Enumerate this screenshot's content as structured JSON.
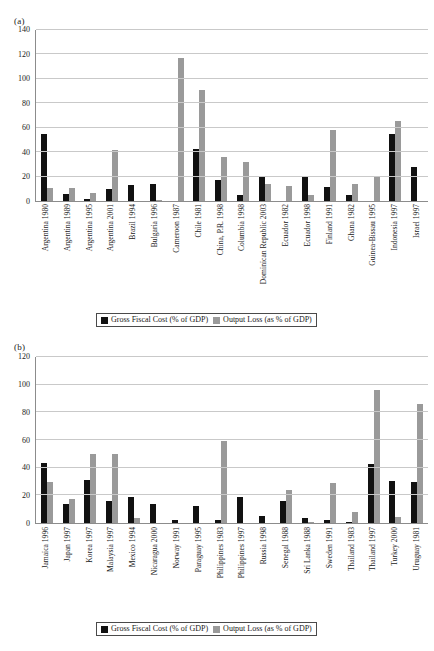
{
  "legend": {
    "fiscal_label": "Gross Fiscal Cost (% of GDP)",
    "output_label": "Output Loss  (as % of GDP)",
    "fiscal_color": "#111111",
    "output_color": "#9a9a9a"
  },
  "panel_a": {
    "label": "(a)"
  },
  "panel_b": {
    "label": "(b)"
  },
  "chart_data": [
    {
      "type": "bar",
      "title": "(a)",
      "xlabel": "",
      "ylabel": "",
      "ylim": [
        0,
        140
      ],
      "yticks": [
        0,
        20,
        40,
        60,
        80,
        100,
        120,
        140
      ],
      "grid": true,
      "legend_position": "bottom",
      "categories": [
        "Argentina 1980",
        "Argentina 1989",
        "Argentina 1995",
        "Argentina 2001",
        "Brazil 1994",
        "Bulgaria 1996",
        "Cameroon 1987",
        "Chile 1981",
        "China, P.R. 1998",
        "Columbia 1998",
        "Dominican Republic 2003",
        "Ecuador 1982",
        "Ecuador 1998",
        "Finland 1991",
        "Ghana 1982",
        "Guinea-Bissau 1995",
        "Indonesia 1997",
        "Israel 1997"
      ],
      "series": [
        {
          "name": "Gross Fiscal Cost (% of GDP)",
          "color": "#111111",
          "values": [
            55,
            6,
            2,
            9.6,
            13,
            14,
            0,
            42.5,
            17,
            5,
            20.5,
            0,
            20,
            11.5,
            4.7,
            0,
            55,
            28
          ]
        },
        {
          "name": "Output Loss  (as % of GDP)",
          "color": "#9a9a9a",
          "values": [
            10.5,
            10.5,
            6.5,
            42,
            0,
            0.6,
            117,
            91,
            36,
            32,
            14,
            12,
            5,
            58,
            14,
            20.5,
            65.5,
            0
          ]
        }
      ]
    },
    {
      "type": "bar",
      "title": "(b)",
      "xlabel": "",
      "ylabel": "",
      "ylim": [
        0,
        120
      ],
      "yticks": [
        0,
        20,
        40,
        60,
        80,
        100,
        120
      ],
      "grid": true,
      "legend_position": "bottom",
      "categories": [
        "Jamaica 1996",
        "Japan 1997",
        "Korea 1997",
        "Malaysia 1997",
        "Mexico 1994",
        "Nicaragua 2000",
        "Norway 1991",
        "Paraguay 1995",
        "Philippines 1983",
        "Philippines 1997",
        "Russia 1998",
        "Senegal 1988",
        "Sri Lanka 1988",
        "Sweden 1991",
        "Thailand 1983",
        "Thailand 1997",
        "Turkey 2000",
        "Uruguay 1981"
      ],
      "series": [
        {
          "name": "Gross Fiscal Cost (% of GDP)",
          "color": "#111111",
          "values": [
            43.5,
            14,
            31,
            16,
            19,
            13.5,
            2,
            12.5,
            2.5,
            19,
            5,
            16,
            3.6,
            2.5,
            0.8,
            42.5,
            30.5,
            29.5
          ]
        },
        {
          "name": "Output Loss  (as % of GDP)",
          "color": "#9a9a9a",
          "values": [
            30,
            17.5,
            50,
            50,
            3.5,
            0,
            0,
            0,
            59.5,
            0,
            0,
            24,
            1,
            29,
            8,
            96.5,
            4,
            86
          ]
        }
      ]
    }
  ]
}
